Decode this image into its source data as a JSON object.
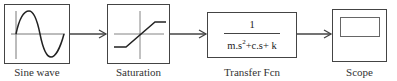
{
  "diagram": {
    "type": "simulink-block-diagram",
    "blocks": [
      {
        "id": "sine",
        "label": "Sine wave",
        "icon": "sine-wave-icon"
      },
      {
        "id": "saturation",
        "label": "Saturation",
        "icon": "saturation-icon"
      },
      {
        "id": "transfer",
        "label": "Transfer Fcn",
        "numerator": "1",
        "denominator_parts": [
          "m.s",
          "2",
          "+c.s+ k"
        ]
      },
      {
        "id": "scope",
        "label": "Scope",
        "icon": "scope-screen-icon"
      }
    ],
    "connections": [
      {
        "from": "sine",
        "to": "saturation"
      },
      {
        "from": "saturation",
        "to": "transfer"
      },
      {
        "from": "transfer",
        "to": "scope"
      }
    ],
    "colors": {
      "line": "#444444",
      "background": "#ffffff"
    }
  }
}
